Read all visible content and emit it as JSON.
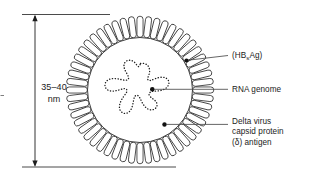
{
  "figure": {
    "background_color": "#ffffff",
    "stroke_color": "#1a1a1a",
    "dimension": {
      "name": "particle-diameter",
      "value": "35–40",
      "unit": "nm",
      "line1": "35–40",
      "line2": "nm"
    },
    "callouts": [
      {
        "id": "hbsag",
        "text": "(HBsAg)",
        "prefix": "(HB",
        "subscript": "s",
        "suffix": "Ag)",
        "target": "envelope-surface-antigen"
      },
      {
        "id": "rna-genome",
        "line1": "RNA genome",
        "target": "rna-genome-strand"
      },
      {
        "id": "delta-antigen",
        "line1": "Delta virus",
        "line2": "capsid protein",
        "line3": "(δ) antigen",
        "target": "delta-antigen-dot"
      }
    ],
    "structures": {
      "envelope_spikes": 52,
      "inner_membrane": "inner-circle",
      "genome_style": "dotted-closed-loop",
      "marker_dots": 3
    }
  }
}
